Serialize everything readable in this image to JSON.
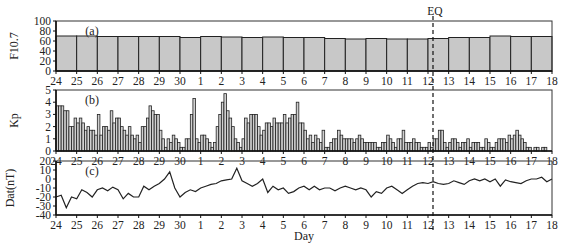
{
  "chart_data": [
    {
      "type": "bar",
      "panel_tag": "(a)",
      "ylabel": "F10.7",
      "xlabel": "",
      "ylim": [
        0,
        100
      ],
      "yticks": [
        0,
        20,
        40,
        60,
        80,
        100
      ],
      "grid": false,
      "categories": [
        "24",
        "25",
        "26",
        "27",
        "28",
        "29",
        "30",
        "1",
        "2",
        "3",
        "4",
        "5",
        "6",
        "7",
        "8",
        "9",
        "10",
        "11",
        "12",
        "13",
        "14",
        "15",
        "16",
        "17"
      ],
      "values": [
        70,
        70,
        69,
        69,
        69,
        69,
        67,
        69,
        68,
        67,
        68,
        67,
        67,
        65,
        64,
        65,
        64,
        64,
        65,
        67,
        67,
        70,
        69,
        69
      ]
    },
    {
      "type": "bar",
      "panel_tag": "(b)",
      "ylabel": "Kp",
      "xlabel": "",
      "ylim": [
        0,
        5
      ],
      "yticks": [
        0,
        1,
        2,
        3,
        4,
        5
      ],
      "grid": false,
      "resolution": "3-hourly (8 per day)",
      "values": [
        3.7,
        3.7,
        3.7,
        3.3,
        3.3,
        2.0,
        2.0,
        2.7,
        2.3,
        2.7,
        2.3,
        1.7,
        2.0,
        1.7,
        1.7,
        1.3,
        3.0,
        1.3,
        2.0,
        2.0,
        1.7,
        3.3,
        2.3,
        2.7,
        2.7,
        2.0,
        1.7,
        1.3,
        2.0,
        1.3,
        1.0,
        1.3,
        0.7,
        2.0,
        2.0,
        2.7,
        3.7,
        3.3,
        3.0,
        3.0,
        1.7,
        1.0,
        0.3,
        1.0,
        0.7,
        1.3,
        1.0,
        0.7,
        0.3,
        0.3,
        1.0,
        1.0,
        3.0,
        4.3,
        1.0,
        0.7,
        1.3,
        1.3,
        1.0,
        0.7,
        0.3,
        0.7,
        2.0,
        3.0,
        4.0,
        4.7,
        3.3,
        2.7,
        2.0,
        1.0,
        0.7,
        0.3,
        1.0,
        2.7,
        2.3,
        3.0,
        3.0,
        3.0,
        2.0,
        1.3,
        1.7,
        2.3,
        2.3,
        2.0,
        2.7,
        2.3,
        2.3,
        2.3,
        3.0,
        2.3,
        2.7,
        3.0,
        3.0,
        4.0,
        2.3,
        2.3,
        1.7,
        1.0,
        1.3,
        0.7,
        1.3,
        1.0,
        0.7,
        1.7,
        0.3,
        0.3,
        0.7,
        1.0,
        1.0,
        1.7,
        1.3,
        1.0,
        1.0,
        1.0,
        1.0,
        0.7,
        1.0,
        1.3,
        1.0,
        0.7,
        0.7,
        0.7,
        0.7,
        0.7,
        0.3,
        0.3,
        0.7,
        0.7,
        1.3,
        1.0,
        0.7,
        0.3,
        1.0,
        1.0,
        1.7,
        0.7,
        0.7,
        0.7,
        1.0,
        0.7,
        0.7,
        0.3,
        0.3,
        0.3,
        0.7,
        0.3,
        1.0,
        1.0,
        1.7,
        1.7,
        0.7,
        0.3,
        0.7,
        1.0,
        1.0,
        0.7,
        0.3,
        0.7,
        0.7,
        1.0,
        0.3,
        0.7,
        0.7,
        0.7,
        0.3,
        0.3,
        1.0,
        0.7,
        0.3,
        0.3,
        0.7,
        1.0,
        1.0,
        1.0,
        0.7,
        1.3,
        1.0,
        1.3,
        1.7,
        1.3,
        1.0,
        0.7,
        0.3,
        0.3,
        0.0,
        0.3,
        0.3,
        0.0,
        0.3,
        0.3,
        0.0,
        0.0
      ]
    },
    {
      "type": "line",
      "panel_tag": "(c)",
      "ylabel": "Dat(nT)",
      "xlabel": "Day",
      "ylim": [
        -40,
        20
      ],
      "yticks": [
        -40,
        -30,
        -20,
        -10,
        0,
        10,
        20
      ],
      "grid": false,
      "x_days_from_start": [
        0,
        0.25,
        0.5,
        0.75,
        1,
        1.25,
        1.5,
        1.75,
        2,
        2.25,
        2.5,
        2.75,
        3,
        3.25,
        3.5,
        3.75,
        4,
        4.25,
        4.5,
        4.75,
        5,
        5.25,
        5.5,
        5.75,
        6,
        6.25,
        6.5,
        6.75,
        7,
        7.25,
        7.5,
        7.75,
        8,
        8.25,
        8.5,
        8.75,
        9,
        9.25,
        9.5,
        9.75,
        10,
        10.25,
        10.5,
        10.75,
        11,
        11.25,
        11.5,
        11.75,
        12,
        12.25,
        12.5,
        12.75,
        13,
        13.25,
        13.5,
        13.75,
        14,
        14.25,
        14.5,
        14.75,
        15,
        15.25,
        15.5,
        15.75,
        16,
        16.25,
        16.5,
        16.75,
        17,
        17.25,
        17.5,
        17.75,
        18,
        18.25,
        18.5,
        18.75,
        19,
        19.25,
        19.5,
        19.75,
        20,
        20.25,
        20.5,
        20.75,
        21,
        21.25,
        21.5,
        21.75,
        22,
        22.25,
        22.5,
        22.75,
        23,
        23.25,
        23.5,
        23.75,
        24
      ],
      "values": [
        -20,
        -18,
        -32,
        -20,
        -22,
        -12,
        -15,
        -20,
        -12,
        -10,
        -13,
        -9,
        -12,
        -22,
        -16,
        -20,
        -20,
        -8,
        -12,
        -8,
        -5,
        0,
        8,
        -10,
        -20,
        -15,
        -12,
        -14,
        -10,
        -8,
        -6,
        -5,
        -2,
        -1,
        0,
        12,
        -2,
        -5,
        -8,
        -5,
        0,
        -15,
        -8,
        -12,
        -10,
        -16,
        -14,
        -10,
        -8,
        -12,
        -8,
        -12,
        -10,
        -10,
        -13,
        -10,
        -8,
        -10,
        -12,
        -10,
        -12,
        -20,
        -14,
        -16,
        -10,
        -8,
        -12,
        -16,
        -12,
        -8,
        -5,
        -4,
        -5,
        -3,
        -5,
        -6,
        -5,
        -2,
        -4,
        -6,
        -2,
        0,
        -2,
        0,
        -3,
        0,
        -8,
        -1,
        -3,
        -4,
        -5,
        -2,
        0,
        0,
        2,
        -3,
        0,
        -6,
        -10,
        -8,
        -8,
        -8,
        -6
      ],
      "annotations": [
        {
          "label": "EQ",
          "x_day": "12 (~12.4)",
          "style": "dashed vertical line across all panels"
        }
      ]
    }
  ],
  "x_axis": {
    "tick_labels": [
      "24",
      "25",
      "26",
      "27",
      "28",
      "29",
      "30",
      "1",
      "2",
      "3",
      "4",
      "5",
      "6",
      "7",
      "8",
      "9",
      "10",
      "11",
      "12",
      "13",
      "14",
      "15",
      "16",
      "17",
      "18"
    ],
    "xlabel": "Day"
  },
  "event_marker": {
    "label": "EQ"
  }
}
